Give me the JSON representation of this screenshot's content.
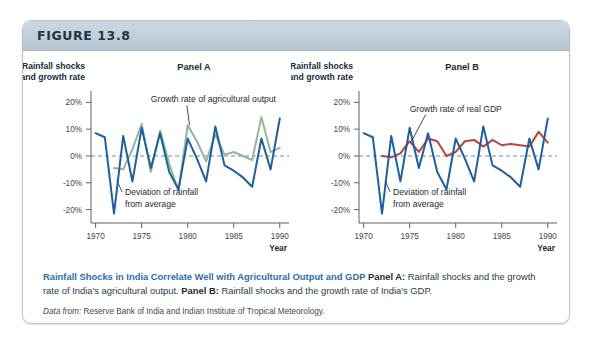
{
  "figure": {
    "number": "FIGURE 13.8"
  },
  "caption": {
    "headline": "Rainfall Shocks in India Correlate Well with Agricultural Output and GDP",
    "panel_a_label": "Panel A:",
    "panel_a_text": " Rainfall shocks and the growth rate of India's agricultural output. ",
    "panel_b_label": "Panel B:",
    "panel_b_text": " Rainfall shocks and the growth rate of India's GDP.",
    "source_prefix": "Data from:",
    "source_text": " Reserve Bank of India and Indian Institute of Tropical Meteorology."
  },
  "colors": {
    "rainfall_blue": "#1f5f9e",
    "agriculture_green": "#8fb89a",
    "gdp_red": "#b8453a",
    "zero_line": "#7a8b96",
    "axis": "#55636d",
    "header_accent": "#2b6ea8"
  },
  "chart_data": [
    {
      "type": "line",
      "title": "Panel A",
      "ylabel": "Rainfall shocks and growth rate",
      "ylabel_line1": "Rainfall shocks",
      "ylabel_line2": "and growth rate",
      "xlabel": "Year",
      "ylim": [
        -25,
        22
      ],
      "xlim": [
        1969.5,
        1991
      ],
      "ytick_labels": [
        "20%",
        "10%",
        "0%",
        "-10%",
        "-20%"
      ],
      "ytick_values": [
        20,
        10,
        0,
        -10,
        -20
      ],
      "xtick_labels": [
        "1970",
        "1975",
        "1980",
        "1985",
        "1990"
      ],
      "xtick_values": [
        1970,
        1975,
        1980,
        1985,
        1990
      ],
      "grid": false,
      "zero_reference_line": true,
      "legend_position": "annotation",
      "annotations": [
        {
          "name": "growth-rate-agricultural-output",
          "text": "Growth rate of agricultural output",
          "x": 1976.0,
          "y": 20
        },
        {
          "name": "deviation-of-rainfall-line1",
          "text": "Deviation of rainfall",
          "x": 1973.2,
          "y": -14.5
        },
        {
          "name": "deviation-of-rainfall-line2",
          "text": "from average",
          "x": 1973.2,
          "y": -19.0
        }
      ],
      "x": [
        1970,
        1971,
        1972,
        1973,
        1974,
        1975,
        1976,
        1977,
        1978,
        1979,
        1980,
        1981,
        1982,
        1983,
        1984,
        1985,
        1986,
        1987,
        1988,
        1989,
        1990
      ],
      "series": [
        {
          "name": "Deviation of rainfall from average",
          "color": "#1f5f9e",
          "values": [
            8.5,
            7.0,
            -21.5,
            7.5,
            -9.5,
            10.5,
            -4.5,
            8.5,
            -6.0,
            -12.5,
            6.5,
            -1.0,
            -9.5,
            11.0,
            -3.5,
            -5.5,
            -8.0,
            -11.5,
            6.5,
            -5.0,
            14.0
          ]
        },
        {
          "name": "Growth rate of agricultural output",
          "color": "#8fb89a",
          "values": [
            null,
            null,
            -4.5,
            -5.0,
            2.5,
            12.0,
            -6.0,
            9.5,
            -3.0,
            -13.0,
            11.5,
            5.5,
            -2.0,
            8.0,
            0.5,
            1.5,
            0.0,
            -1.5,
            14.5,
            1.5,
            3.0
          ]
        }
      ]
    },
    {
      "type": "line",
      "title": "Panel B",
      "ylabel": "Rainfall shocks and growth rate",
      "ylabel_line1": "Rainfall shocks",
      "ylabel_line2": "and growth rate",
      "xlabel": "Year",
      "ylim": [
        -25,
        22
      ],
      "xlim": [
        1969.5,
        1991
      ],
      "ytick_labels": [
        "20%",
        "10%",
        "0%",
        "-10%",
        "-20%"
      ],
      "ytick_values": [
        20,
        10,
        0,
        -10,
        -20
      ],
      "xtick_labels": [
        "1970",
        "1975",
        "1980",
        "1985",
        "1990"
      ],
      "xtick_values": [
        1970,
        1975,
        1980,
        1985,
        1990
      ],
      "grid": false,
      "zero_reference_line": true,
      "legend_position": "annotation",
      "annotations": [
        {
          "name": "growth-rate-real-gdp",
          "text": "Growth rate of real GDP",
          "x": 1975.0,
          "y": 16.5
        },
        {
          "name": "deviation-of-rainfall-line1",
          "text": "Deviation of rainfall",
          "x": 1973.2,
          "y": -14.5
        },
        {
          "name": "deviation-of-rainfall-line2",
          "text": "from average",
          "x": 1973.2,
          "y": -19.0
        }
      ],
      "x": [
        1970,
        1971,
        1972,
        1973,
        1974,
        1975,
        1976,
        1977,
        1978,
        1979,
        1980,
        1981,
        1982,
        1983,
        1984,
        1985,
        1986,
        1987,
        1988,
        1989,
        1990
      ],
      "series": [
        {
          "name": "Deviation of rainfall from average",
          "color": "#1f5f9e",
          "values": [
            8.5,
            7.0,
            -21.5,
            7.5,
            -9.5,
            10.5,
            -4.5,
            8.5,
            -6.0,
            -12.5,
            6.5,
            -1.0,
            -9.5,
            11.0,
            -3.5,
            -5.5,
            -8.0,
            -11.5,
            6.5,
            -5.0,
            14.0
          ]
        },
        {
          "name": "Growth rate of real GDP",
          "color": "#b8453a",
          "values": [
            null,
            null,
            0.0,
            -0.5,
            1.0,
            5.5,
            1.5,
            6.5,
            5.5,
            0.0,
            1.5,
            5.5,
            6.0,
            3.5,
            6.0,
            4.0,
            4.5,
            4.0,
            3.5,
            9.0,
            5.0
          ]
        }
      ]
    }
  ]
}
